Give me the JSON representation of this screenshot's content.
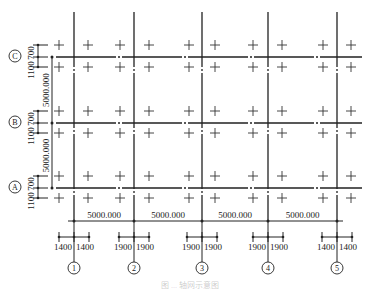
{
  "drawing": {
    "rows": [
      {
        "label": "C",
        "y": 57
      },
      {
        "label": "B",
        "y": 123
      },
      {
        "label": "A",
        "y": 188
      }
    ],
    "columns": [
      {
        "label": "1",
        "x": 74,
        "left": "1400",
        "right": "1400",
        "off": 15
      },
      {
        "label": "2",
        "x": 134,
        "left": "1900",
        "right": "1900",
        "off": 15
      },
      {
        "label": "3",
        "x": 202,
        "left": "1900",
        "right": "1900",
        "off": 15
      },
      {
        "label": "4",
        "x": 268,
        "left": "1900",
        "right": "1900",
        "off": 15
      },
      {
        "label": "5",
        "x": 337,
        "left": "1400",
        "right": "1400",
        "off": 15
      }
    ],
    "row_offsets": {
      "top": "700",
      "bottom": "1100"
    },
    "row_spacing": [
      "5000.000",
      "5000.000"
    ],
    "column_spacing": [
      "5000.000",
      "5000.000",
      "5000.000",
      "5000.000"
    ],
    "cross_xs": [
      59,
      88,
      120,
      149,
      189,
      215,
      253,
      282,
      323,
      351
    ],
    "caption": "图 ... 轴网示意图"
  }
}
